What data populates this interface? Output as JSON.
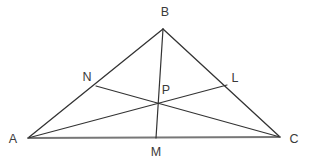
{
  "figure": {
    "kind": "geometry-diagram",
    "canvas": {
      "width": 311,
      "height": 162,
      "background": "#ffffff"
    },
    "style": {
      "triangle_side_color": "#333333",
      "triangle_side_width": 1.3,
      "base_line_color": "#777777",
      "base_line_width": 2.0,
      "cevian_color": "#333333",
      "cevian_width": 1.2,
      "label_color": "#3a3a3a",
      "label_font_size": "12.5px"
    },
    "points": [
      {
        "id": "A",
        "label": "A",
        "x": 28,
        "y": 138,
        "label_x": 13,
        "label_y": 139,
        "role": "vertex"
      },
      {
        "id": "B",
        "label": "B",
        "x": 163,
        "y": 29,
        "label_x": 165,
        "label_y": 12,
        "role": "vertex"
      },
      {
        "id": "C",
        "label": "C",
        "x": 280,
        "y": 137,
        "label_x": 294,
        "label_y": 139,
        "role": "vertex"
      },
      {
        "id": "N",
        "label": "N",
        "x": 96,
        "y": 86,
        "label_x": 87,
        "label_y": 77,
        "role": "point-on-side-AB"
      },
      {
        "id": "L",
        "label": "L",
        "x": 227,
        "y": 85,
        "label_x": 235,
        "label_y": 78,
        "role": "point-on-side-BC"
      },
      {
        "id": "M",
        "label": "M",
        "x": 156,
        "y": 138,
        "label_x": 156,
        "label_y": 152,
        "role": "point-on-side-AC"
      },
      {
        "id": "P",
        "label": "P",
        "x": 157,
        "y": 102,
        "label_x": 166,
        "label_y": 90,
        "role": "intersection"
      }
    ],
    "segments": [
      {
        "id": "side-AB",
        "from": "A",
        "to": "B",
        "kind": "triangle-side"
      },
      {
        "id": "side-BC",
        "from": "B",
        "to": "C",
        "kind": "triangle-side"
      },
      {
        "id": "side-AC",
        "from": "A",
        "to": "C",
        "kind": "triangle-base"
      },
      {
        "id": "cevian-BM",
        "from": "B",
        "to": "M",
        "kind": "cevian"
      },
      {
        "id": "cevian-AL",
        "from": "A",
        "to": "L",
        "kind": "cevian"
      },
      {
        "id": "cevian-NC",
        "from": "N",
        "to": "C",
        "kind": "cevian"
      }
    ]
  }
}
